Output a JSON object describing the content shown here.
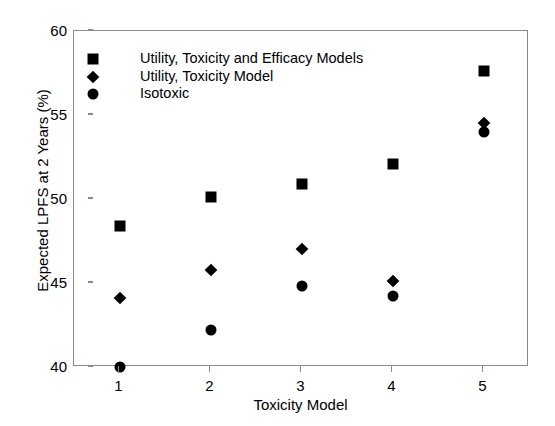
{
  "chart_data": {
    "type": "scatter",
    "title": "",
    "xlabel": "Toxicity Model",
    "ylabel": "Expected LPFS at 2 Years (%)",
    "categories": [
      "1",
      "2",
      "3",
      "4",
      "5"
    ],
    "x": [
      1,
      2,
      3,
      4,
      5
    ],
    "xlim": [
      0.5,
      5.5
    ],
    "ylim": [
      40,
      60
    ],
    "xticks": [
      "1",
      "2",
      "3",
      "4",
      "5"
    ],
    "yticks": [
      "40",
      "45",
      "50",
      "55",
      "60"
    ],
    "grid": false,
    "legend_position": "upper-left-inside",
    "series": [
      {
        "name": "Utility, Toxicity and Efficacy Models",
        "marker": "square",
        "color": "#000000",
        "values": [
          48.4,
          50.1,
          50.9,
          52.1,
          57.6
        ]
      },
      {
        "name": "Utility, Toxicity Model",
        "marker": "diamond",
        "color": "#000000",
        "values": [
          44.1,
          45.8,
          47.0,
          45.1,
          54.5
        ]
      },
      {
        "name": "Isotoxic",
        "marker": "circle",
        "color": "#000000",
        "values": [
          40.0,
          42.2,
          44.8,
          44.2,
          54.0
        ]
      }
    ]
  },
  "axes": {
    "frame_color": "#8a8a8a",
    "background": "#ffffff"
  },
  "legend": {
    "entries": [
      {
        "label": "Utility, Toxicity and Efficacy Models",
        "marker": "square-marker-icon"
      },
      {
        "label": "Utility, Toxicity Model",
        "marker": "diamond-marker-icon"
      },
      {
        "label": "Isotoxic",
        "marker": "circle-marker-icon"
      }
    ]
  }
}
